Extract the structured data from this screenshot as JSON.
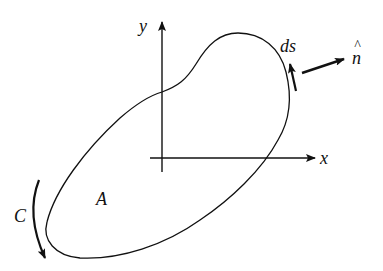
{
  "diagram": {
    "type": "closed-curve-with-axes",
    "colors": {
      "stroke": "#111111",
      "background": "#ffffff"
    },
    "axes": {
      "x_label": "x",
      "y_label": "y"
    },
    "region_label": "A",
    "curve_label": "C",
    "element_label": "ds",
    "normal_label": "n̂",
    "normal_hat": "^",
    "normal_letter": "n"
  }
}
